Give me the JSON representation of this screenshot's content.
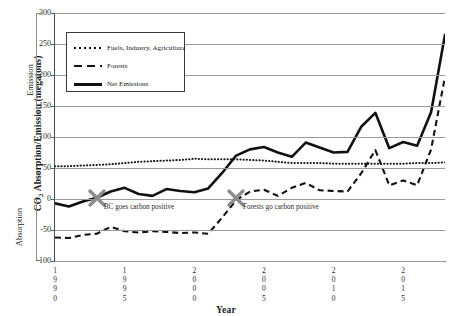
{
  "figure": {
    "clipped_top_title": "",
    "xlabel": "Year",
    "ylabel_outer": "CO",
    "ylabel_outer_sub": "2",
    "ylabel_outer_rest": " Absorption/Emission (megatons)",
    "ylabel_emission": "Emission",
    "ylabel_absorption": "Absorption"
  },
  "legend": {
    "items": [
      {
        "label": "Fuels, Industry, Agriculture",
        "style": "dotted",
        "color": "#111111"
      },
      {
        "label": "Forests",
        "style": "dashed",
        "color": "#111111"
      },
      {
        "label": "Net Emissions",
        "style": "solid",
        "color": "#111111"
      }
    ]
  },
  "annotations": [
    {
      "text": "BC goes carbon positive",
      "x_year": 1993,
      "y_value": 2,
      "marker": "x-marker",
      "color": "#8c8c8c"
    },
    {
      "text": "Forests go carbon positive",
      "x_year": 2003,
      "y_value": 1,
      "marker": "x-marker",
      "color": "#8c8c8c"
    }
  ],
  "chart_data": {
    "type": "line",
    "title": "",
    "xlabel": "Year",
    "ylabel": "CO2 Absorption/Emission (megatons)",
    "xlim": [
      1990,
      2018
    ],
    "ylim": [
      -100,
      300
    ],
    "yticks": [
      -100,
      -50,
      0,
      50,
      100,
      150,
      200,
      250,
      300
    ],
    "xticks": [
      1990,
      1995,
      2000,
      2005,
      2010,
      2015
    ],
    "grid": "horizontal",
    "legend_position": "upper-left",
    "x": [
      1990,
      1991,
      1992,
      1993,
      1994,
      1995,
      1996,
      1997,
      1998,
      1999,
      2000,
      2001,
      2002,
      2003,
      2004,
      2005,
      2006,
      2007,
      2008,
      2009,
      2010,
      2011,
      2012,
      2013,
      2014,
      2015,
      2016,
      2017,
      2018
    ],
    "series": [
      {
        "name": "Fuels, Industry, Agriculture",
        "style": "dotted",
        "values": [
          53,
          53,
          54,
          55,
          56,
          58,
          60,
          61,
          62,
          63,
          65,
          64,
          64,
          64,
          63,
          62,
          60,
          58,
          58,
          58,
          57,
          57,
          57,
          57,
          57,
          57,
          58,
          58,
          59
        ]
      },
      {
        "name": "Forests",
        "style": "dashed",
        "values": [
          -62,
          -63,
          -58,
          -56,
          -45,
          -52,
          -54,
          -52,
          -53,
          -55,
          -54,
          -56,
          -30,
          -2,
          12,
          15,
          5,
          18,
          26,
          14,
          13,
          12,
          42,
          79,
          22,
          30,
          22,
          80,
          197
        ]
      },
      {
        "name": "Net Emissions",
        "style": "solid",
        "values": [
          -7,
          -12,
          -4,
          2,
          12,
          18,
          8,
          5,
          16,
          13,
          11,
          17,
          42,
          70,
          80,
          84,
          75,
          68,
          91,
          83,
          75,
          76,
          117,
          139,
          82,
          92,
          86,
          140,
          265
        ]
      }
    ]
  }
}
